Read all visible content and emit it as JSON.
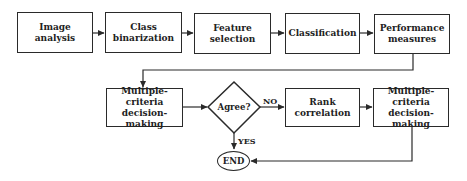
{
  "diagram": {
    "type": "flowchart",
    "row1": [
      {
        "id": "image-analysis",
        "line1": "Image",
        "line2": "analysis"
      },
      {
        "id": "class-binarization",
        "line1": "Class",
        "line2": "binarization"
      },
      {
        "id": "feature-selection",
        "line1": "Feature",
        "line2": "selection"
      },
      {
        "id": "classification",
        "line1": "Classification",
        "line2": ""
      },
      {
        "id": "performance-measures",
        "line1": "Performance",
        "line2": "measures"
      }
    ],
    "row2": [
      {
        "id": "mcdm-1",
        "line1": "Multiple-criteria",
        "line2": "decision-making"
      },
      {
        "id": "rank-correlation",
        "line1": "Rank",
        "line2": "correlation"
      },
      {
        "id": "mcdm-2",
        "line1": "Multiple-criteria",
        "line2": "decision-making"
      }
    ],
    "decision": {
      "label": "Agree?",
      "no_label": "NO",
      "yes_label": "YES"
    },
    "end": {
      "label": "END"
    },
    "edges": [
      [
        "Image analysis",
        "Class binarization"
      ],
      [
        "Class binarization",
        "Feature selection"
      ],
      [
        "Feature selection",
        "Classification"
      ],
      [
        "Classification",
        "Performance measures"
      ],
      [
        "Performance measures",
        "Multiple-criteria decision-making (1)"
      ],
      [
        "Multiple-criteria decision-making (1)",
        "Agree?"
      ],
      [
        "Agree?",
        "Rank correlation",
        "NO"
      ],
      [
        "Agree?",
        "END",
        "YES"
      ],
      [
        "Rank correlation",
        "Multiple-criteria decision-making (2)"
      ],
      [
        "Multiple-criteria decision-making (2)",
        "END"
      ]
    ]
  }
}
